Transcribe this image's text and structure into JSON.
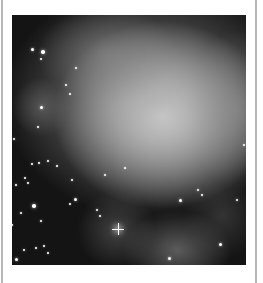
{
  "figure": {
    "palette": {
      "background": "#141414",
      "core": "#ffffff",
      "nebula_mid": "#9a9a9a",
      "frame": "#b8b8b8"
    },
    "glows": [
      {
        "x": 150,
        "y": 100,
        "rx": 110,
        "ry": 95,
        "inner": "rgba(255,255,255,0.95)",
        "outer": "rgba(150,150,150,0)"
      },
      {
        "x": 140,
        "y": 85,
        "rx": 150,
        "ry": 120,
        "inner": "rgba(170,170,170,0.75)",
        "outer": "rgba(100,100,100,0)"
      },
      {
        "x": 95,
        "y": 40,
        "rx": 70,
        "ry": 50,
        "inner": "rgba(140,140,140,0.6)",
        "outer": "rgba(80,80,80,0)"
      },
      {
        "x": 225,
        "y": 95,
        "rx": 50,
        "ry": 80,
        "inner": "rgba(150,150,150,0.5)",
        "outer": "rgba(80,80,80,0)"
      },
      {
        "x": 30,
        "y": 92,
        "rx": 30,
        "ry": 30,
        "inner": "rgba(110,110,110,0.6)",
        "outer": "rgba(60,60,60,0)"
      },
      {
        "x": 165,
        "y": 235,
        "rx": 55,
        "ry": 40,
        "inner": "rgba(150,150,150,0.55)",
        "outer": "rgba(80,80,80,0)"
      },
      {
        "x": 105,
        "y": 215,
        "rx": 40,
        "ry": 40,
        "inner": "rgba(110,110,110,0.5)",
        "outer": "rgba(60,60,60,0)"
      },
      {
        "x": 210,
        "y": 200,
        "rx": 40,
        "ry": 45,
        "inner": "rgba(90,90,90,0.45)",
        "outer": "rgba(50,50,50,0)"
      }
    ],
    "burst": {
      "x": 106,
      "y": 214
    },
    "stars": [
      {
        "x": 20,
        "y": 34,
        "r": 1.5
      },
      {
        "x": 31,
        "y": 37,
        "r": 1.8
      },
      {
        "x": 29,
        "y": 44,
        "r": 1.2
      },
      {
        "x": 64,
        "y": 53,
        "r": 1.2
      },
      {
        "x": 54,
        "y": 70,
        "r": 1.2
      },
      {
        "x": 58,
        "y": 79,
        "r": 1.0
      },
      {
        "x": 29,
        "y": 92,
        "r": 1.5
      },
      {
        "x": 26,
        "y": 112,
        "r": 1.0
      },
      {
        "x": 2,
        "y": 124,
        "r": 1.2
      },
      {
        "x": 20,
        "y": 149,
        "r": 1.0
      },
      {
        "x": 27,
        "y": 148,
        "r": 1.0
      },
      {
        "x": 36,
        "y": 146,
        "r": 1.0
      },
      {
        "x": 45,
        "y": 151,
        "r": 1.0
      },
      {
        "x": 13,
        "y": 163,
        "r": 1.0
      },
      {
        "x": 16,
        "y": 168,
        "r": 1.0
      },
      {
        "x": 4,
        "y": 170,
        "r": 1.0
      },
      {
        "x": 60,
        "y": 165,
        "r": 1.0
      },
      {
        "x": 93,
        "y": 160,
        "r": 1.2
      },
      {
        "x": 113,
        "y": 153,
        "r": 1.0
      },
      {
        "x": 22,
        "y": 191,
        "r": 1.8
      },
      {
        "x": 63,
        "y": 184,
        "r": 1.5
      },
      {
        "x": 58,
        "y": 189,
        "r": 1.0
      },
      {
        "x": 9,
        "y": 198,
        "r": 1.2
      },
      {
        "x": 29,
        "y": 206,
        "r": 1.2
      },
      {
        "x": 85,
        "y": 195,
        "r": 1.2
      },
      {
        "x": 88,
        "y": 201,
        "r": 1.0
      },
      {
        "x": 12,
        "y": 235,
        "r": 1.2
      },
      {
        "x": 24,
        "y": 233,
        "r": 1.0
      },
      {
        "x": 32,
        "y": 231,
        "r": 1.0
      },
      {
        "x": 36,
        "y": 238,
        "r": 1.0
      },
      {
        "x": 4,
        "y": 244,
        "r": 1.5
      },
      {
        "x": 157,
        "y": 243,
        "r": 1.5
      },
      {
        "x": 168,
        "y": 185,
        "r": 1.5
      },
      {
        "x": 186,
        "y": 175,
        "r": 1.2
      },
      {
        "x": 190,
        "y": 180,
        "r": 1.0
      },
      {
        "x": 225,
        "y": 185,
        "r": 1.2
      },
      {
        "x": 208,
        "y": 229,
        "r": 1.5
      },
      {
        "x": 232,
        "y": 130,
        "r": 1.0
      },
      {
        "x": 0,
        "y": 210,
        "r": 1.0
      }
    ]
  }
}
